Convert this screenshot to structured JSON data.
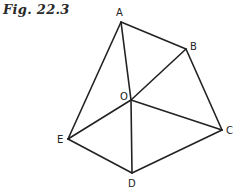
{
  "figure": {
    "caption": "Fig. 22.3",
    "points": {
      "A": {
        "label": "A",
        "x": 121,
        "y": 22,
        "lx": 116,
        "ly": 16
      },
      "B": {
        "label": "B",
        "x": 186,
        "y": 49,
        "lx": 190,
        "ly": 50
      },
      "C": {
        "label": "C",
        "x": 222,
        "y": 130,
        "lx": 226,
        "ly": 134
      },
      "D": {
        "label": "D",
        "x": 132,
        "y": 173,
        "lx": 128,
        "ly": 187
      },
      "E": {
        "label": "E",
        "x": 68,
        "y": 139,
        "lx": 57,
        "ly": 143
      },
      "O": {
        "label": "O",
        "x": 131,
        "y": 100,
        "lx": 120,
        "ly": 100
      }
    },
    "edges": [
      [
        "A",
        "B"
      ],
      [
        "B",
        "C"
      ],
      [
        "C",
        "D"
      ],
      [
        "D",
        "E"
      ],
      [
        "E",
        "A"
      ],
      [
        "O",
        "A"
      ],
      [
        "O",
        "B"
      ],
      [
        "O",
        "C"
      ],
      [
        "O",
        "D"
      ],
      [
        "O",
        "E"
      ]
    ]
  }
}
